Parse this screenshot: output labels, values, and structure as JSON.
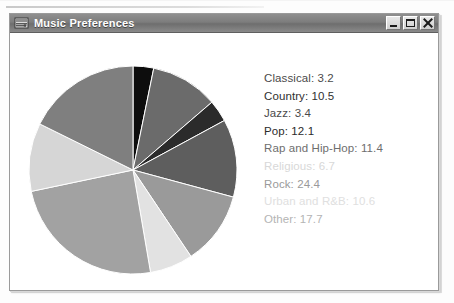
{
  "window": {
    "title": "Music Preferences",
    "icon": "java-duke-icon",
    "controls": [
      {
        "name": "minimize-button",
        "glyph": "minimize"
      },
      {
        "name": "maximize-button",
        "glyph": "maximize"
      },
      {
        "name": "close-button",
        "glyph": "close"
      }
    ]
  },
  "chart_data": {
    "type": "pie",
    "title": "",
    "legend_position": "right",
    "start_angle_deg": 90,
    "direction": "clockwise",
    "categories": [
      "Classical",
      "Country",
      "Jazz",
      "Pop",
      "Rap and Hip-Hop",
      "Religious",
      "Rock",
      "Urban and R&B",
      "Other"
    ],
    "values": [
      3.2,
      10.5,
      3.4,
      12.1,
      11.4,
      6.7,
      24.4,
      10.6,
      17.7
    ],
    "colors": [
      "#0d0d0d",
      "#6b6b6b",
      "#2b2b2b",
      "#5e5e5e",
      "#9a9a9a",
      "#e2e2e2",
      "#a2a2a2",
      "#d6d6d6",
      "#7f7f7f"
    ],
    "legend_text_colors": [
      "#4a4a4a",
      "#2f2f2f",
      "#4a4a4a",
      "#2b2b2b",
      "#6e6e6e",
      "#d8d8d8",
      "#9a9a9a",
      "#e0e0e0",
      "#b4b4b4"
    ],
    "legend_labels": [
      "Classical: 3.2",
      "Country: 10.5",
      "Jazz: 3.4",
      "Pop: 12.1",
      "Rap and Hip-Hop: 11.4",
      "Religious: 6.7",
      "Rock: 24.4",
      "Urban and R&B: 10.6",
      "Other: 17.7"
    ]
  }
}
